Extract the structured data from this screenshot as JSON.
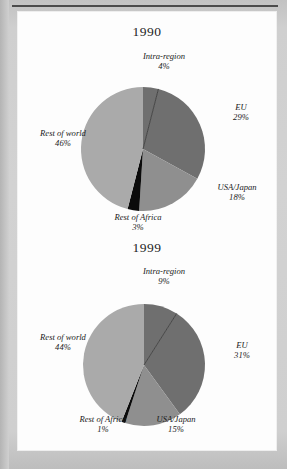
{
  "page": {
    "background_color": "#cfcfcf",
    "panel_color": "#fdfdfd",
    "rule_color": "#3a3a3a",
    "clipped_heading": ""
  },
  "palette": {
    "intra_region": "#6f6f6f",
    "eu": "#6f6f6f",
    "usa_japan": "#8f8f8f",
    "rest_of_africa": "#0b0b0b",
    "rest_of_world": "#aaaaaa",
    "divider": "#3d3d3d"
  },
  "chart_data": [
    {
      "type": "pie",
      "title": "1990",
      "xlabel": "",
      "ylabel": "",
      "legend_position": "callout-labels",
      "grid": false,
      "categories": [
        "Intra-region",
        "EU",
        "USA/Japan",
        "Rest of Africa",
        "Rest of world"
      ],
      "values": [
        4,
        29,
        18,
        3,
        46
      ],
      "value_labels": [
        "4%",
        "29%",
        "18%",
        "3%",
        "46%"
      ],
      "colors": [
        "#6f6f6f",
        "#6f6f6f",
        "#8f8f8f",
        "#0b0b0b",
        "#aaaaaa"
      ]
    },
    {
      "type": "pie",
      "title": "1999",
      "xlabel": "",
      "ylabel": "",
      "legend_position": "callout-labels",
      "grid": false,
      "categories": [
        "Intra-region",
        "EU",
        "USA/Japan",
        "Rest of Africa",
        "Rest of world"
      ],
      "values": [
        9,
        31,
        15,
        1,
        44
      ],
      "value_labels": [
        "9%",
        "31%",
        "15%",
        "1%",
        "44%"
      ],
      "colors": [
        "#6f6f6f",
        "#6f6f6f",
        "#8f8f8f",
        "#0b0b0b",
        "#aaaaaa"
      ]
    }
  ]
}
